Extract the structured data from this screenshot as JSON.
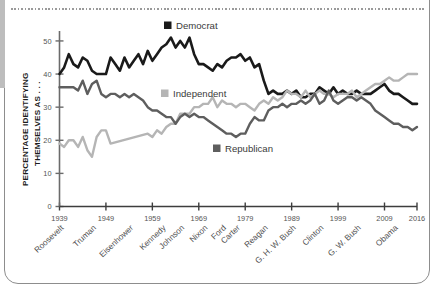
{
  "figure": {
    "frame_color": "#8d8d8d",
    "gutter_color": "#bdbdbd",
    "background": "#ffffff"
  },
  "chart_data": {
    "type": "line",
    "title": "",
    "xlabel": "",
    "ylabel": "PERCENTAGE IDENTIFYING THEMSELVES AS . . .",
    "ylabel_line1": "PERCENTAGE IDENTIFYING",
    "ylabel_line2": "THEMSELVES AS . . .",
    "xlim": [
      1939,
      2016
    ],
    "ylim": [
      0,
      53
    ],
    "grid": false,
    "legend_position": "inside-plot",
    "yticks": [
      0,
      10,
      20,
      30,
      40,
      50
    ],
    "ytick_labels": [
      "0",
      "10",
      "20",
      "30",
      "40",
      "50"
    ],
    "xticks": [
      1939,
      1949,
      1959,
      1969,
      1979,
      1989,
      1999,
      2009,
      2016
    ],
    "xtick_labels": [
      "1939",
      "1949",
      "1959",
      "1969",
      "1979",
      "1989",
      "1999",
      "2009",
      "2016"
    ],
    "presidents": [
      {
        "label": "Roosevelt",
        "year": 1940
      },
      {
        "label": "Truman",
        "year": 1947
      },
      {
        "label": "Eisenhower",
        "year": 1955
      },
      {
        "label": "Kennedy",
        "year": 1962
      },
      {
        "label": "Johnson",
        "year": 1966
      },
      {
        "label": "Nixon",
        "year": 1971
      },
      {
        "label": "Ford",
        "year": 1975
      },
      {
        "label": "Carter",
        "year": 1978
      },
      {
        "label": "Reagan",
        "year": 1984
      },
      {
        "label": "G. H. W. Bush",
        "year": 1990
      },
      {
        "label": "Clinton",
        "year": 1996
      },
      {
        "label": "G. W. Bush",
        "year": 2004
      },
      {
        "label": "Obama",
        "year": 2012
      }
    ],
    "series": [
      {
        "name": "Democrat",
        "color": "#1a1a1a",
        "x": [
          1939,
          1940,
          1941,
          1942,
          1943,
          1944,
          1945,
          1946,
          1947,
          1948,
          1949,
          1950,
          1951,
          1952,
          1953,
          1954,
          1955,
          1956,
          1957,
          1958,
          1959,
          1960,
          1961,
          1962,
          1963,
          1964,
          1965,
          1966,
          1967,
          1968,
          1969,
          1970,
          1971,
          1972,
          1973,
          1974,
          1975,
          1976,
          1977,
          1978,
          1979,
          1980,
          1981,
          1982,
          1983,
          1984,
          1985,
          1986,
          1987,
          1988,
          1989,
          1990,
          1991,
          1992,
          1993,
          1994,
          1995,
          1996,
          1997,
          1998,
          1999,
          2000,
          2001,
          2002,
          2003,
          2004,
          2005,
          2006,
          2007,
          2008,
          2009,
          2010,
          2011,
          2012,
          2013,
          2014,
          2015,
          2016
        ],
        "values": [
          40,
          42,
          46,
          43,
          42,
          45,
          44,
          41,
          40,
          40,
          40,
          45,
          43,
          41,
          45,
          42,
          44,
          46,
          43,
          47,
          44,
          46,
          48,
          49,
          51,
          48,
          50,
          48,
          51,
          46,
          43,
          43,
          42,
          41,
          43,
          42,
          44,
          45,
          45,
          46,
          44,
          45,
          42,
          43,
          38,
          34,
          35,
          34,
          34,
          35,
          34,
          35,
          33,
          33,
          34,
          34,
          36,
          35,
          34,
          36,
          34,
          35,
          34,
          34,
          35,
          34,
          34,
          34,
          35,
          36,
          37,
          35,
          34,
          34,
          33,
          32,
          31,
          31
        ],
        "linewidth": 2.6
      },
      {
        "name": "Independent",
        "color": "#b5b5b5",
        "x": [
          1939,
          1940,
          1941,
          1942,
          1943,
          1944,
          1945,
          1946,
          1947,
          1948,
          1949,
          1950,
          1958,
          1959,
          1960,
          1961,
          1962,
          1963,
          1964,
          1965,
          1966,
          1967,
          1968,
          1969,
          1970,
          1971,
          1972,
          1973,
          1974,
          1975,
          1976,
          1977,
          1978,
          1979,
          1980,
          1981,
          1982,
          1983,
          1984,
          1985,
          1986,
          1987,
          1988,
          1989,
          1990,
          1991,
          1992,
          1993,
          1994,
          1995,
          1996,
          1997,
          1998,
          1999,
          2000,
          2001,
          2002,
          2003,
          2004,
          2005,
          2006,
          2007,
          2008,
          2009,
          2010,
          2011,
          2012,
          2013,
          2014,
          2015,
          2016
        ],
        "values": [
          19,
          18,
          20,
          20,
          18,
          21,
          17,
          15,
          21,
          23,
          23,
          19,
          22,
          21,
          23,
          22,
          24,
          25,
          25,
          28,
          28,
          28,
          30,
          30,
          31,
          31,
          33,
          30,
          32,
          31,
          31,
          30,
          31,
          31,
          30,
          29,
          31,
          32,
          31,
          33,
          32,
          33,
          35,
          34,
          34,
          33,
          35,
          33,
          34,
          35,
          34,
          34,
          33,
          34,
          34,
          34,
          35,
          33,
          34,
          35,
          36,
          37,
          37,
          38,
          39,
          38,
          38,
          39,
          40,
          40,
          40
        ],
        "linewidth": 2.4
      },
      {
        "name": "Republican",
        "color": "#5e5e5e",
        "x": [
          1939,
          1940,
          1941,
          1942,
          1943,
          1944,
          1945,
          1946,
          1947,
          1948,
          1949,
          1950,
          1951,
          1952,
          1953,
          1954,
          1955,
          1956,
          1957,
          1958,
          1959,
          1960,
          1961,
          1962,
          1963,
          1964,
          1965,
          1966,
          1967,
          1968,
          1969,
          1970,
          1971,
          1972,
          1973,
          1974,
          1975,
          1976,
          1977,
          1978,
          1979,
          1980,
          1981,
          1982,
          1983,
          1984,
          1985,
          1986,
          1987,
          1988,
          1989,
          1990,
          1991,
          1992,
          1993,
          1994,
          1995,
          1996,
          1997,
          1998,
          1999,
          2000,
          2001,
          2002,
          2003,
          2004,
          2005,
          2006,
          2007,
          2008,
          2009,
          2010,
          2011,
          2012,
          2013,
          2014,
          2015,
          2016
        ],
        "values": [
          36,
          36,
          36,
          36,
          35,
          38,
          34,
          37,
          38,
          34,
          33,
          34,
          34,
          33,
          34,
          33,
          34,
          33,
          32,
          30,
          29,
          29,
          28,
          27,
          27,
          25,
          27,
          28,
          27,
          28,
          27,
          27,
          26,
          25,
          24,
          23,
          22,
          22,
          21,
          22,
          22,
          25,
          27,
          26,
          26,
          29,
          30,
          30,
          31,
          30,
          31,
          31,
          32,
          31,
          32,
          34,
          31,
          32,
          35,
          32,
          31,
          32,
          33,
          33,
          32,
          33,
          32,
          31,
          29,
          28,
          27,
          26,
          25,
          25,
          24,
          24,
          23,
          24
        ],
        "linewidth": 2.4
      }
    ],
    "legend": [
      {
        "label": "Democrat",
        "color": "#1a1a1a"
      },
      {
        "label": "Independent",
        "color": "#b5b5b5"
      },
      {
        "label": "Republican",
        "color": "#5e5e5e"
      }
    ]
  }
}
